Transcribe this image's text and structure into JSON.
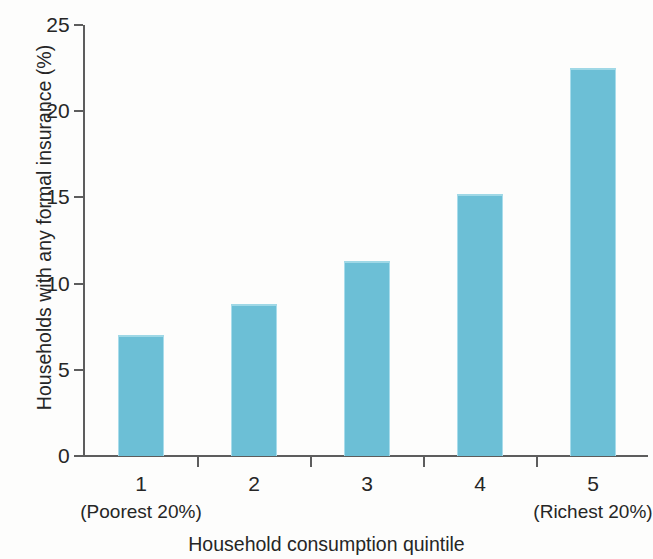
{
  "chart_data": {
    "type": "bar",
    "title": "",
    "categories": [
      "1",
      "2",
      "3",
      "4",
      "5"
    ],
    "category_sublabels": [
      "(Poorest 20%)",
      "",
      "",
      "",
      "(Richest 20%)"
    ],
    "values": [
      7.0,
      8.8,
      11.3,
      15.2,
      22.5
    ],
    "series": [
      {
        "name": "Households with any formal insurance",
        "values": [
          7.0,
          8.8,
          11.3,
          15.2,
          22.5
        ]
      }
    ],
    "xlabel": "Household consumption quintile",
    "ylabel": "Households with any formal insurance (%)",
    "ylim": [
      0,
      25
    ],
    "ytick_labels": [
      "0",
      "5",
      "10",
      "15",
      "20",
      "25"
    ],
    "ytick_values": [
      0,
      5,
      10,
      15,
      20,
      25
    ],
    "grid": false,
    "legend": "none",
    "bar_color": "#6cbfd6",
    "axis_color": "#5d5d5d"
  },
  "axes": {
    "y_title": "Households with any formal insurance (%)",
    "x_title": "Household consumption quintile"
  }
}
